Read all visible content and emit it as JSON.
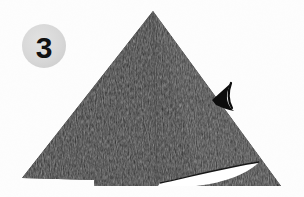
{
  "figure": {
    "name": "origami-fold-step",
    "background_color": "#fdfdfd",
    "width": 304,
    "height": 197
  },
  "step_badge": {
    "label": "3",
    "circle_color": "#d8d8d8",
    "text_color": "#111111",
    "center_x": 44,
    "center_y": 46,
    "radius": 22
  },
  "shapes": {
    "paper": {
      "name": "folded-paper-triangle",
      "fill_color": "#1c1c1c",
      "texture": "speckled-halftone",
      "apex_x": 153,
      "apex_y": 11,
      "left_x": 22,
      "left_y": 178,
      "right_x": 281,
      "right_y": 186,
      "baseline_y": 186
    },
    "opening": {
      "name": "white-lens-opening",
      "fill_color": "#ffffff",
      "left_tip_x": 160,
      "left_tip_y": 183,
      "right_tip_x": 259,
      "right_tip_y": 162
    },
    "arrow": {
      "name": "fold-direction-arrow",
      "fill_color": "#0d0d0d",
      "tip_x": 212,
      "tip_y": 100,
      "direction": "left-down"
    },
    "creases": {
      "name": "fold-crease-lines",
      "stroke_color": "#3a3a3a",
      "count": 2
    }
  }
}
